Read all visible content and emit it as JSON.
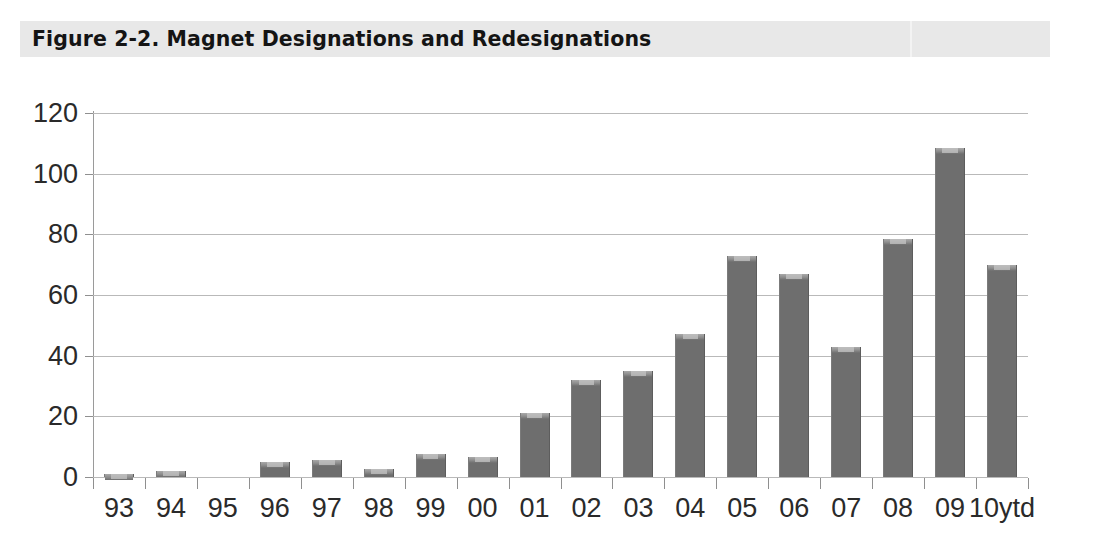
{
  "figure": {
    "title": "Figure 2-2. Magnet Designations and Redesignations",
    "band_color": "#e8e8e8"
  },
  "chart_data": {
    "type": "bar",
    "title": "Figure 2-2. Magnet Designations and Redesignations",
    "xlabel": "",
    "ylabel": "",
    "ylim": [
      0,
      120
    ],
    "yticks": [
      0,
      20,
      40,
      60,
      80,
      100,
      120
    ],
    "grid": true,
    "legend": "none",
    "bar_color": "#6e6e6e",
    "categories": [
      "93",
      "94",
      "95",
      "96",
      "97",
      "98",
      "99",
      "00",
      "01",
      "02",
      "03",
      "04",
      "05",
      "06",
      "07",
      "08",
      "09",
      "10ytd"
    ],
    "values": [
      1,
      2,
      0,
      5,
      5.5,
      2.5,
      7.5,
      6.5,
      21,
      32,
      35,
      47,
      73,
      67,
      43,
      78.5,
      108.5,
      70
    ]
  }
}
